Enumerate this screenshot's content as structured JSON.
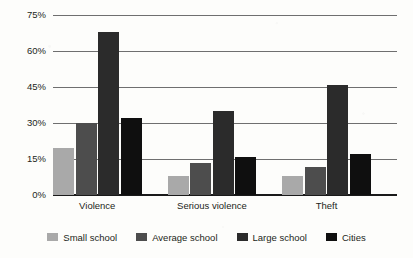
{
  "chart_data": {
    "type": "bar",
    "title": "",
    "xlabel": "",
    "ylabel": "",
    "categories": [
      "Violence",
      "Serious violence",
      "Theft"
    ],
    "series": [
      {
        "name": "Small school",
        "color": "#a9a9a9",
        "values": [
          19.5,
          8.0,
          8.0
        ]
      },
      {
        "name": "Average school",
        "color": "#4d4d4d",
        "values": [
          30.0,
          13.5,
          11.5
        ]
      },
      {
        "name": "Large school",
        "color": "#2b2b2b",
        "values": [
          68.0,
          35.0,
          46.0
        ]
      },
      {
        "name": "Cities",
        "color": "#0f0f0f",
        "values": [
          32.0,
          15.8,
          17.0
        ]
      }
    ],
    "ylim": [
      0,
      75
    ],
    "ytick_values": [
      0,
      15,
      30,
      45,
      60,
      75
    ],
    "ytick_labels": [
      "0%",
      "15%",
      "30%",
      "45%",
      "60%",
      "75%"
    ],
    "unit": "%",
    "grid": true,
    "grid_axis": "y",
    "legend_position": "bottom"
  },
  "axis": {
    "gridline_color": "#6f6f6f",
    "baseline_color": "#1a1a1a",
    "tick_label_color": "#231f20"
  },
  "page": {
    "background": "#fdfdfb"
  }
}
